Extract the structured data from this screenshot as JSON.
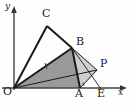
{
  "figure": {
    "background": "#fefefe",
    "axes": {
      "origin_label": "O",
      "x_axis_label": "x",
      "y_axis_label": "y",
      "axis_color": "#444444",
      "origin_px": [
        14,
        88
      ],
      "x_axis_end_px": [
        126,
        88
      ],
      "y_axis_end_px": [
        14,
        7
      ]
    },
    "points": [
      {
        "name": "O",
        "label": "O",
        "x": 14,
        "y": 88,
        "label_x": 3,
        "label_y": 89
      },
      {
        "name": "C",
        "label": "C",
        "x": 47,
        "y": 26,
        "label_x": 42,
        "label_y": 11
      },
      {
        "name": "B",
        "label": "B",
        "x": 72,
        "y": 48,
        "label_x": 76,
        "label_y": 40
      },
      {
        "name": "A",
        "label": "A",
        "x": 80,
        "y": 88,
        "label_x": 76,
        "label_y": 90
      },
      {
        "name": "E",
        "label": "E",
        "x": 101,
        "y": 88,
        "label_x": 97,
        "label_y": 90
      },
      {
        "name": "P",
        "label": "P",
        "x": 97,
        "y": 70,
        "label_x": 100,
        "label_y": 61
      }
    ],
    "segments": [
      {
        "name": "O-C",
        "from": "O",
        "to": "C",
        "style": "thick-black"
      },
      {
        "name": "C-B",
        "from": "C",
        "to": "B",
        "style": "thick-black"
      },
      {
        "name": "O-B",
        "from": "O",
        "to": "B",
        "style": "thick-black"
      },
      {
        "name": "B-A",
        "from": "B",
        "to": "A",
        "style": "thick-black"
      },
      {
        "name": "B-P",
        "from": "B",
        "to": "P",
        "style": "thin-black"
      },
      {
        "name": "A-P",
        "from": "A",
        "to": "P",
        "style": "thin-black"
      },
      {
        "name": "O-P",
        "from": "O",
        "to": "P",
        "style": "thin-black"
      },
      {
        "name": "O-E",
        "from": "O",
        "to": "E",
        "style": "axis"
      }
    ],
    "regions": [
      {
        "name": "quad-O-B-A",
        "vertices": "O,B,A",
        "fill": "#9a9a9a",
        "description": "dark grey filled triangle O B A"
      },
      {
        "name": "tri-B-P-A",
        "vertices": "B,P,A",
        "fill": "#cfcfcf",
        "description": "light grey triangle B P A"
      },
      {
        "name": "sliver-O-A-P",
        "vertices": "O,A,P",
        "fill": "#dcdcdc",
        "description": "thin light sliver from O to A toward P"
      }
    ],
    "tick_marks": [
      {
        "name": "tick-on-OB",
        "on_segment": "O-B",
        "x": 46,
        "y": 66
      }
    ],
    "colors": {
      "stroke": "#1a1a1a",
      "axis": "#444444",
      "fill_dark": "#9a9a9a",
      "fill_light": "#cfcfcf",
      "fill_sliver": "#dcdcdc",
      "text": "#1a1a1a"
    }
  }
}
